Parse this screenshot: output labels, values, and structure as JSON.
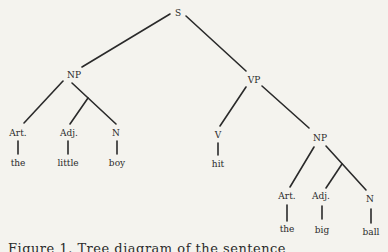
{
  "diagram": {
    "type": "syntax-tree",
    "sentence": "the little boy hit the big ball",
    "nodes": {
      "s": "S",
      "np1": "NP",
      "vp": "VP",
      "art1": "Art.",
      "adj1": "Adj.",
      "n1": "N",
      "the1": "the",
      "little": "little",
      "boy": "boy",
      "v": "V",
      "hit": "hit",
      "np2": "NP",
      "art2": "Art.",
      "adj2": "Adj.",
      "n2": "N",
      "the2": "the",
      "big": "big",
      "ball": "ball"
    },
    "caption": "Figure 1. Tree diagram of the sentence"
  }
}
